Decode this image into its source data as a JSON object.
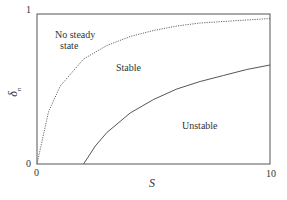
{
  "chart_data": {
    "type": "line",
    "title": "",
    "xlabel": "S",
    "ylabel": "δ_n",
    "xlim": [
      0,
      10
    ],
    "ylim": [
      0,
      1
    ],
    "x_ticks": [
      "0",
      "10"
    ],
    "y_ticks": [
      "0",
      "1"
    ],
    "grid": false,
    "series": [
      {
        "name": "steady state boundary (dotted)",
        "style": "dotted",
        "x": [
          0,
          0.5,
          1,
          2,
          3,
          4,
          5,
          6,
          7,
          8,
          9,
          10
        ],
        "y": [
          0,
          0.35,
          0.52,
          0.7,
          0.79,
          0.85,
          0.89,
          0.92,
          0.94,
          0.95,
          0.96,
          0.97
        ]
      },
      {
        "name": "stability boundary (solid)",
        "style": "solid",
        "x": [
          2,
          2.5,
          3,
          4,
          5,
          6,
          7,
          8,
          9,
          10
        ],
        "y": [
          0,
          0.12,
          0.21,
          0.34,
          0.43,
          0.5,
          0.55,
          0.59,
          0.63,
          0.66
        ]
      }
    ],
    "annotations": [
      {
        "text": "No steady state",
        "x": 1.8,
        "y": 0.85
      },
      {
        "text": "Stable",
        "x": 4.6,
        "y": 0.63
      },
      {
        "text": "Unstable",
        "x": 6.8,
        "y": 0.25
      }
    ]
  },
  "labels": {
    "region_no_steady_line1": "No steady",
    "region_no_steady_line2": "state",
    "region_stable": "Stable",
    "region_unstable": "Unstable",
    "x_tick_0": "0",
    "x_tick_10": "10",
    "y_tick_0": "0",
    "y_tick_1": "1",
    "x_axis_label": "S",
    "y_axis_label_main": "δ",
    "y_axis_label_sub": "n"
  }
}
